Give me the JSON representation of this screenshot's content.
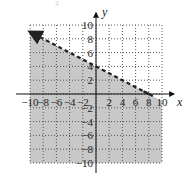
{
  "chart_data": {
    "type": "line",
    "title": "",
    "top_mark": "2",
    "xlabel": "x",
    "ylabel": "y",
    "xlim": [
      -10,
      10
    ],
    "ylim": [
      -10,
      10
    ],
    "grid": true,
    "grid_style": "dotted",
    "x_ticks": [
      -10,
      -8,
      -6,
      -4,
      -2,
      2,
      4,
      6,
      8,
      10
    ],
    "y_ticks": [
      10,
      8,
      6,
      4,
      2,
      -2,
      -4,
      -6,
      -8,
      -10
    ],
    "x_tick_labels": [
      "−10",
      "−8",
      "−6",
      "−4",
      "−2",
      "2",
      "4",
      "6",
      "8",
      "10"
    ],
    "y_tick_labels": [
      "10",
      "8",
      "6",
      "4",
      "2",
      "−2",
      "−4",
      "−6",
      "−8",
      "−10"
    ],
    "boundary_line": {
      "equation": "y = -0.5x + 4",
      "style": "dashed",
      "points": [
        [
          -10,
          9
        ],
        [
          8,
          0
        ]
      ],
      "y_intercept": 4,
      "x_intercept": 8,
      "arrow_at": [
        -10,
        9
      ]
    },
    "shaded_region": "below",
    "inequality": "y < -1/2 x + 4",
    "colors": {
      "shade": "#c8c8c8",
      "line": "#222222",
      "grid": "#555555",
      "axis": "#111111"
    }
  }
}
